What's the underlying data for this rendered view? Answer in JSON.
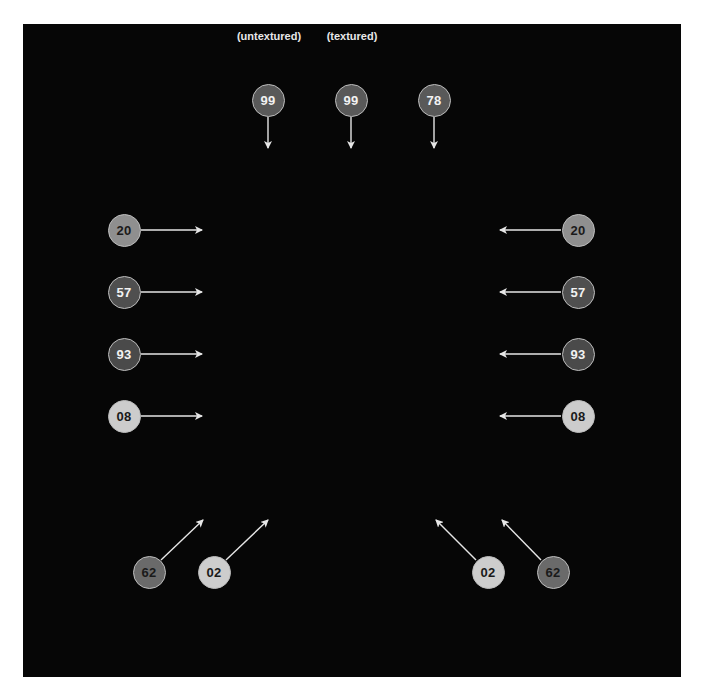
{
  "colors": {
    "background": "#060606",
    "frame": "#ffffff",
    "arrow": "#e6e6e6",
    "marker_outline": "#bdbdbd",
    "tone_dark": "#4a4a4a",
    "tone_mid": "#5e5e5e",
    "tone_light": "#999999",
    "tone_pale": "#cfcfcf",
    "text_light": "#f2f2f2",
    "text_dark": "#1a1a1a"
  },
  "labels": [
    {
      "id": "untextured",
      "text": "(untextured)",
      "x": 269,
      "y": 38
    },
    {
      "id": "textured",
      "text": "(textured)",
      "x": 352,
      "y": 38
    }
  ],
  "markers": [
    {
      "id": "top-untextured",
      "value": "99",
      "cx": 268,
      "cy": 100,
      "fill": "#595959",
      "text": "#f2f2f2",
      "arrow": {
        "x1": 268,
        "y1": 117,
        "x2": 268,
        "y2": 148
      }
    },
    {
      "id": "top-textured",
      "value": "99",
      "cx": 351,
      "cy": 100,
      "fill": "#595959",
      "text": "#f2f2f2",
      "arrow": {
        "x1": 351,
        "y1": 117,
        "x2": 351,
        "y2": 148
      }
    },
    {
      "id": "top-right",
      "value": "78",
      "cx": 434,
      "cy": 100,
      "fill": "#595959",
      "text": "#f2f2f2",
      "arrow": {
        "x1": 434,
        "y1": 117,
        "x2": 434,
        "y2": 148
      }
    },
    {
      "id": "left-1",
      "value": "20",
      "cx": 124,
      "cy": 230,
      "fill": "#8f8f8f",
      "text": "#1a1a1a",
      "arrow": {
        "x1": 141,
        "y1": 230,
        "x2": 202,
        "y2": 230
      }
    },
    {
      "id": "left-2",
      "value": "57",
      "cx": 124,
      "cy": 292,
      "fill": "#4f4f4f",
      "text": "#f2f2f2",
      "arrow": {
        "x1": 141,
        "y1": 292,
        "x2": 202,
        "y2": 292
      }
    },
    {
      "id": "left-3",
      "value": "93",
      "cx": 124,
      "cy": 354,
      "fill": "#4a4a4a",
      "text": "#f2f2f2",
      "arrow": {
        "x1": 141,
        "y1": 354,
        "x2": 202,
        "y2": 354
      }
    },
    {
      "id": "left-4",
      "value": "08",
      "cx": 124,
      "cy": 416,
      "fill": "#cccccc",
      "text": "#1a1a1a",
      "arrow": {
        "x1": 141,
        "y1": 416,
        "x2": 202,
        "y2": 416
      }
    },
    {
      "id": "right-1",
      "value": "20",
      "cx": 578,
      "cy": 230,
      "fill": "#8f8f8f",
      "text": "#1a1a1a",
      "arrow": {
        "x1": 561,
        "y1": 230,
        "x2": 500,
        "y2": 230
      }
    },
    {
      "id": "right-2",
      "value": "57",
      "cx": 578,
      "cy": 292,
      "fill": "#4f4f4f",
      "text": "#f2f2f2",
      "arrow": {
        "x1": 561,
        "y1": 292,
        "x2": 500,
        "y2": 292
      }
    },
    {
      "id": "right-3",
      "value": "93",
      "cx": 578,
      "cy": 354,
      "fill": "#4a4a4a",
      "text": "#f2f2f2",
      "arrow": {
        "x1": 561,
        "y1": 354,
        "x2": 500,
        "y2": 354
      }
    },
    {
      "id": "right-4",
      "value": "08",
      "cx": 578,
      "cy": 416,
      "fill": "#cccccc",
      "text": "#1a1a1a",
      "arrow": {
        "x1": 561,
        "y1": 416,
        "x2": 500,
        "y2": 416
      }
    },
    {
      "id": "bottom-left-outer",
      "value": "62",
      "cx": 149,
      "cy": 572,
      "fill": "#6a6a6a",
      "text": "#1a1a1a",
      "arrow": {
        "x1": 161,
        "y1": 560,
        "x2": 203,
        "y2": 520
      }
    },
    {
      "id": "bottom-left-inner",
      "value": "02",
      "cx": 214,
      "cy": 572,
      "fill": "#cdcdcd",
      "text": "#1a1a1a",
      "arrow": {
        "x1": 226,
        "y1": 560,
        "x2": 268,
        "y2": 520
      }
    },
    {
      "id": "bottom-right-inner",
      "value": "02",
      "cx": 488,
      "cy": 572,
      "fill": "#cdcdcd",
      "text": "#1a1a1a",
      "arrow": {
        "x1": 476,
        "y1": 560,
        "x2": 436,
        "y2": 520
      }
    },
    {
      "id": "bottom-right-outer",
      "value": "62",
      "cx": 553,
      "cy": 572,
      "fill": "#6a6a6a",
      "text": "#1a1a1a",
      "arrow": {
        "x1": 541,
        "y1": 560,
        "x2": 502,
        "y2": 520
      }
    }
  ]
}
